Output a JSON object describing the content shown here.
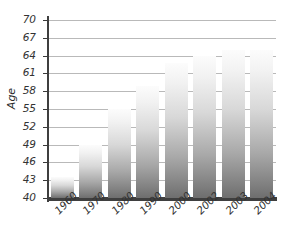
{
  "chart_data": {
    "type": "bar",
    "title": "",
    "xlabel": "",
    "ylabel": "Age",
    "categories": [
      "1960",
      "1970",
      "1980",
      "1990",
      "2000",
      "2002",
      "2003",
      "2004"
    ],
    "values": [
      43.5,
      49.0,
      55.0,
      58.9,
      62.8,
      64.0,
      65.0,
      65.0
    ],
    "ylim": [
      40,
      70
    ],
    "ytick_labels": [
      "70",
      "67",
      "64",
      "61",
      "58",
      "55",
      "52",
      "49",
      "46",
      "43",
      "40"
    ],
    "ytick_values": [
      70,
      67,
      64,
      61,
      58,
      55,
      52,
      49,
      46,
      43,
      40
    ],
    "ystep": 3,
    "grid": true,
    "legend": "none",
    "series": [
      {
        "name": "Age",
        "values": [
          43.5,
          49.0,
          55.0,
          58.9,
          62.8,
          64.0,
          65.0,
          65.0
        ]
      }
    ],
    "bar_fill_top_color": "#fcfcfc",
    "bar_fill_bottom_color": "#6e6e6e",
    "axis_color": "#3f3f3f",
    "gridline_color": "#b9b9b9",
    "text_color": "#333333",
    "background_color": "#ffffff"
  }
}
